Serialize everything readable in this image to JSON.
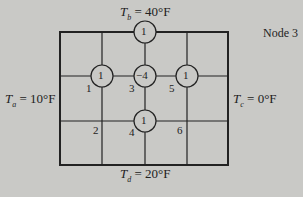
{
  "diagram": {
    "title": "Node 3",
    "boundaries": {
      "top": {
        "var": "T",
        "sub": "b",
        "value": "= 40°F"
      },
      "left": {
        "var": "T",
        "sub": "a",
        "value": "= 10°F"
      },
      "right": {
        "var": "T",
        "sub": "c",
        "value": "= 0°F"
      },
      "bottom": {
        "var": "T",
        "sub": "d",
        "value": "= 20°F"
      }
    },
    "stencil": {
      "top": "1",
      "left": "1",
      "center": "−4",
      "right": "1",
      "bottom": "1"
    },
    "node_labels": [
      "1",
      "2",
      "3",
      "4",
      "5",
      "6"
    ],
    "colors": {
      "background": "#c9c9c6",
      "line": "#222222"
    }
  }
}
